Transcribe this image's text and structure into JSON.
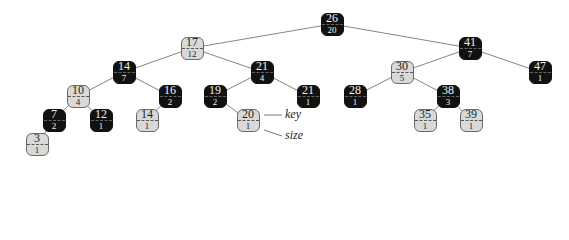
{
  "diagram": {
    "type": "order-statistic red-black tree",
    "legend": {
      "key_label": "key",
      "size_label": "size",
      "annotated_node": "n20"
    },
    "colors": {
      "red_node_fill": "#d9d9d9",
      "black_node_fill": "#111111",
      "edge": "#777777"
    },
    "nodes": [
      {
        "id": "n26",
        "key": "26",
        "size": "20",
        "color": "black",
        "x": 332,
        "y": 24
      },
      {
        "id": "n17",
        "key": "17",
        "size": "12",
        "color": "red",
        "x": 192,
        "y": 48
      },
      {
        "id": "n41",
        "key": "41",
        "size": "7",
        "color": "black",
        "x": 470,
        "y": 48
      },
      {
        "id": "n14",
        "key": "14",
        "size": "7",
        "color": "black",
        "x": 124,
        "y": 72
      },
      {
        "id": "n21",
        "key": "21",
        "size": "4",
        "color": "black",
        "x": 262,
        "y": 72
      },
      {
        "id": "n30",
        "key": "30",
        "size": "5",
        "color": "red",
        "x": 402,
        "y": 72
      },
      {
        "id": "n47",
        "key": "47",
        "size": "1",
        "color": "black",
        "x": 540,
        "y": 72
      },
      {
        "id": "n10",
        "key": "10",
        "size": "4",
        "color": "red",
        "x": 78,
        "y": 96
      },
      {
        "id": "n16",
        "key": "16",
        "size": "2",
        "color": "black",
        "x": 170,
        "y": 96
      },
      {
        "id": "n19",
        "key": "19",
        "size": "2",
        "color": "black",
        "x": 215,
        "y": 96
      },
      {
        "id": "n21b",
        "key": "21",
        "size": "1",
        "color": "black",
        "x": 308,
        "y": 96
      },
      {
        "id": "n28",
        "key": "28",
        "size": "1",
        "color": "black",
        "x": 355,
        "y": 96
      },
      {
        "id": "n38",
        "key": "38",
        "size": "3",
        "color": "black",
        "x": 448,
        "y": 96
      },
      {
        "id": "n7",
        "key": "7",
        "size": "2",
        "color": "black",
        "x": 54,
        "y": 120
      },
      {
        "id": "n12",
        "key": "12",
        "size": "1",
        "color": "black",
        "x": 101,
        "y": 120
      },
      {
        "id": "n14b",
        "key": "14",
        "size": "1",
        "color": "red",
        "x": 147,
        "y": 120
      },
      {
        "id": "n20",
        "key": "20",
        "size": "1",
        "color": "red",
        "x": 248,
        "y": 120
      },
      {
        "id": "n35",
        "key": "35",
        "size": "1",
        "color": "red",
        "x": 425,
        "y": 120
      },
      {
        "id": "n39",
        "key": "39",
        "size": "1",
        "color": "red",
        "x": 471,
        "y": 120
      },
      {
        "id": "n3",
        "key": "3",
        "size": "1",
        "color": "red",
        "x": 37,
        "y": 144
      }
    ],
    "edges": [
      [
        "n26",
        "n17"
      ],
      [
        "n26",
        "n41"
      ],
      [
        "n17",
        "n14"
      ],
      [
        "n17",
        "n21"
      ],
      [
        "n41",
        "n30"
      ],
      [
        "n41",
        "n47"
      ],
      [
        "n14",
        "n10"
      ],
      [
        "n14",
        "n16"
      ],
      [
        "n21",
        "n19"
      ],
      [
        "n21",
        "n21b"
      ],
      [
        "n30",
        "n28"
      ],
      [
        "n30",
        "n38"
      ],
      [
        "n10",
        "n7"
      ],
      [
        "n10",
        "n12"
      ],
      [
        "n16",
        "n14b"
      ],
      [
        "n19",
        "n20"
      ],
      [
        "n38",
        "n35"
      ],
      [
        "n38",
        "n39"
      ],
      [
        "n7",
        "n3"
      ]
    ]
  }
}
